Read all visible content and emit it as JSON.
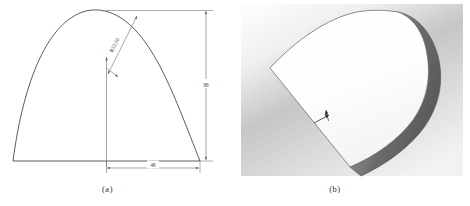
{
  "figure": {
    "type": "engineering-drawing-with-3d-view",
    "panels": [
      {
        "id": "a",
        "caption": "(a)",
        "kind": "2d-dimensioned-outline",
        "description": "Front view of a dome-topped tapered plate with dimensions"
      },
      {
        "id": "b",
        "caption": "(b)",
        "kind": "3d-shaded-render",
        "description": "Isometric shaded render of the extruded plate"
      }
    ]
  },
  "drawing": {
    "dimensions": [
      {
        "name": "radius",
        "label": "R52.50",
        "kind": "radial-leader",
        "rotated": true
      },
      {
        "name": "height",
        "label": "88",
        "kind": "linear-vertical"
      },
      {
        "name": "width",
        "label": "48",
        "kind": "linear-horizontal"
      }
    ],
    "line_color": "#4a4a4a",
    "dim_color": "#6a6a6a",
    "text_color": "#3a3a3a"
  },
  "render": {
    "background_top": "#fbfbfb",
    "background_mid": "#c9c9c9",
    "background_bottom": "#e8e8e8",
    "face_color": "#fdfdfd",
    "edge_color": "#6f6f6f",
    "side_dark": "#5e5e5e",
    "side_light": "#8c8c8c",
    "leader_color": "#2a2a2a"
  },
  "captions": {
    "a": "(a)",
    "b": "(b)"
  }
}
